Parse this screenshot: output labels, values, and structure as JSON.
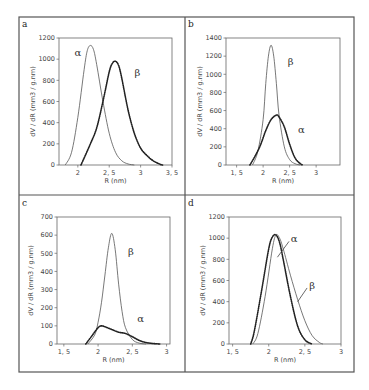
{
  "figure": {
    "frame": {
      "left": 19,
      "top": 17,
      "right": 354,
      "bottom": 372,
      "col_split": 185,
      "row_split": 195
    }
  },
  "chart_data": [
    {
      "panel": "a",
      "type": "line",
      "xlabel": "R (nm)",
      "ylabel": "dV / dR  (mm3 / g.nm)",
      "xlim": [
        1.7,
        3.5
      ],
      "ylim": [
        0,
        1200
      ],
      "xticks": [
        2,
        2.5,
        3,
        3.5
      ],
      "xtick_labels": [
        "2",
        "2, 5",
        "3",
        "3, 5"
      ],
      "yticks": [
        0,
        200,
        400,
        600,
        800,
        1000,
        1200
      ],
      "grid": false,
      "plot_box": {
        "left": 59,
        "top": 38,
        "right": 172,
        "bottom": 165
      },
      "series": [
        {
          "name": "α",
          "style": "solid",
          "x": [
            1.8,
            1.9,
            2.0,
            2.1,
            2.15,
            2.2,
            2.25,
            2.3,
            2.4,
            2.5,
            2.6,
            2.7,
            2.8,
            2.9
          ],
          "y": [
            0,
            120,
            450,
            900,
            1080,
            1130,
            1090,
            950,
            600,
            300,
            120,
            40,
            10,
            0
          ]
        },
        {
          "name": "β",
          "style": "dotted",
          "x": [
            2.05,
            2.2,
            2.3,
            2.4,
            2.5,
            2.55,
            2.6,
            2.65,
            2.7,
            2.8,
            2.9,
            3.0,
            3.1,
            3.2,
            3.3,
            3.35
          ],
          "y": [
            0,
            200,
            350,
            600,
            880,
            960,
            980,
            940,
            820,
            520,
            300,
            160,
            90,
            40,
            10,
            0
          ]
        }
      ],
      "annotations": [
        {
          "text": "α",
          "x": 2.0,
          "y": 1030
        },
        {
          "text": "β",
          "x": 2.95,
          "y": 840
        }
      ]
    },
    {
      "panel": "b",
      "type": "line",
      "xlabel": "R (nm)",
      "ylabel": "dV / dR  (mm3 / g.nm)",
      "xlim": [
        1.3,
        3.45
      ],
      "ylim": [
        0,
        1400
      ],
      "xticks": [
        1.5,
        2,
        2.5,
        3
      ],
      "xtick_labels": [
        "1, 5",
        "2",
        "2, 5",
        "3"
      ],
      "yticks": [
        0,
        200,
        400,
        600,
        800,
        1000,
        1200,
        1400
      ],
      "grid": false,
      "plot_box": {
        "left": 226,
        "top": 38,
        "right": 340,
        "bottom": 165
      },
      "series": [
        {
          "name": "β",
          "style": "solid",
          "x": [
            1.8,
            1.9,
            2.0,
            2.05,
            2.1,
            2.15,
            2.2,
            2.25,
            2.3,
            2.4,
            2.5,
            2.6,
            2.7
          ],
          "y": [
            0,
            150,
            500,
            900,
            1200,
            1320,
            1200,
            900,
            550,
            200,
            60,
            15,
            0
          ]
        },
        {
          "name": "α",
          "style": "dotted",
          "x": [
            1.75,
            1.85,
            1.95,
            2.05,
            2.15,
            2.25,
            2.3,
            2.4,
            2.5,
            2.6,
            2.7,
            2.75
          ],
          "y": [
            0,
            100,
            220,
            380,
            500,
            550,
            530,
            420,
            230,
            80,
            15,
            0
          ]
        }
      ],
      "annotations": [
        {
          "text": "β",
          "x": 2.52,
          "y": 1100
        },
        {
          "text": "α",
          "x": 2.72,
          "y": 350
        }
      ]
    },
    {
      "panel": "c",
      "type": "line",
      "xlabel": "R (nm)",
      "ylabel": "dV / dR  (mm3 / g.nm)",
      "xlim": [
        1.4,
        3.05
      ],
      "ylim": [
        0,
        700
      ],
      "xticks": [
        1.5,
        2,
        2.5,
        3
      ],
      "xtick_labels": [
        "1, 5",
        "2",
        "2, 5",
        "3"
      ],
      "yticks": [
        0,
        100,
        200,
        300,
        400,
        500,
        600,
        700
      ],
      "grid": false,
      "plot_box": {
        "left": 57,
        "top": 217,
        "right": 170,
        "bottom": 344
      },
      "series": [
        {
          "name": "β",
          "style": "solid",
          "x": [
            1.85,
            1.95,
            2.0,
            2.05,
            2.1,
            2.15,
            2.2,
            2.25,
            2.3,
            2.35,
            2.4,
            2.5,
            2.6,
            2.7
          ],
          "y": [
            0,
            50,
            120,
            230,
            380,
            530,
            610,
            520,
            330,
            180,
            90,
            25,
            5,
            0
          ]
        },
        {
          "name": "α",
          "style": "dotted",
          "x": [
            1.82,
            1.9,
            2.0,
            2.05,
            2.1,
            2.2,
            2.3,
            2.4,
            2.5,
            2.6,
            2.7,
            2.8,
            2.9
          ],
          "y": [
            0,
            40,
            90,
            100,
            95,
            80,
            65,
            58,
            40,
            20,
            8,
            3,
            0
          ]
        }
      ],
      "annotations": [
        {
          "text": "β",
          "x": 2.48,
          "y": 490
        },
        {
          "text": "α",
          "x": 2.62,
          "y": 120
        }
      ]
    },
    {
      "panel": "d",
      "type": "line",
      "xlabel": "R (nm)",
      "ylabel": "dV / dR  (mm3 / g.nm)",
      "xlim": [
        1.45,
        3.0
      ],
      "ylim": [
        0,
        1200
      ],
      "xticks": [
        1.5,
        2,
        2.5,
        3
      ],
      "xtick_labels": [
        "1, 5",
        "2",
        "2, 5",
        "3"
      ],
      "yticks": [
        0,
        200,
        400,
        600,
        800,
        1000,
        1200
      ],
      "grid": false,
      "plot_box": {
        "left": 229,
        "top": 217,
        "right": 341,
        "bottom": 344
      },
      "series": [
        {
          "name": "α",
          "style": "dotted",
          "x": [
            1.75,
            1.8,
            1.9,
            2.0,
            2.05,
            2.1,
            2.15,
            2.2,
            2.3,
            2.4,
            2.5,
            2.6
          ],
          "y": [
            0,
            120,
            500,
            900,
            1010,
            1030,
            960,
            800,
            450,
            170,
            40,
            0
          ]
        },
        {
          "name": "β",
          "style": "solid",
          "x": [
            1.78,
            1.85,
            1.95,
            2.05,
            2.1,
            2.15,
            2.2,
            2.3,
            2.4,
            2.5,
            2.6,
            2.7,
            2.75
          ],
          "y": [
            0,
            100,
            450,
            900,
            1030,
            1000,
            900,
            650,
            420,
            220,
            80,
            15,
            0
          ]
        }
      ],
      "annotations": [
        {
          "text": "α",
          "x": 2.35,
          "y": 960,
          "arrow_to": [
            2.12,
            820
          ]
        },
        {
          "text": "β",
          "x": 2.6,
          "y": 520,
          "arrow_to": [
            2.4,
            400
          ]
        }
      ]
    }
  ]
}
